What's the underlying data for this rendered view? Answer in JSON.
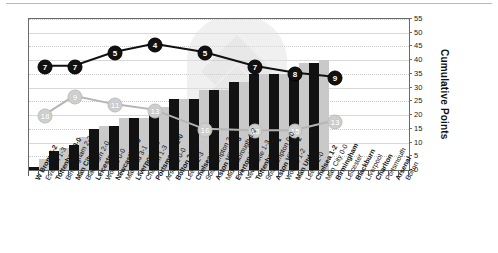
{
  "chart_data": {
    "type": "bar",
    "title": "",
    "xlabel": "",
    "ylabel": "Cumulative Points",
    "ylim": [
      0,
      55
    ],
    "ytick_step": 5,
    "yticks": [
      0,
      5,
      10,
      15,
      20,
      25,
      30,
      35,
      40,
      45,
      50,
      55
    ],
    "grid": true,
    "legend_position": "none",
    "categories": [
      "W Brom 3-2",
      "Everton 1-3",
      "Tottenham 3-0",
      "Birmingham 2-2",
      "Man City 2-2",
      "Blackburn 2-0",
      "Leicester 2-0",
      "Wolves 0-0",
      "Newcastle 2-3",
      "Man Utd 3-1",
      "Liverpool 1-2",
      "Charlton 1-3",
      "Portsmouth 2-0",
      "Arsenal 0-0",
      "Bolton 2-1",
      "Leeds 2-3",
      "Chelsea 0-1",
      "Southampton 2-0",
      "Aston Villa 0-3",
      "Middlesbrough 1-2",
      "Everton 2-1",
      "Newcastle 1-3",
      "Tottenham 2-1",
      "Southampton 0-0",
      "Aston Villa 1-2",
      "Wolves 1-2",
      "Man Utd 1-1",
      "Leeds 2-0",
      "Chelsea 1-2",
      "Man City 0-0",
      "Birmingham",
      "Leicester",
      "Blackburn",
      "Liverpool",
      "Charlton",
      "Portsmouth",
      "Arsenal",
      "Bolton"
    ],
    "series": [
      {
        "name": "Home bars",
        "kind": "bar",
        "values": [
          1,
          4,
          7,
          8,
          9,
          12,
          15,
          16,
          16,
          19,
          19,
          19,
          22,
          23,
          26,
          26,
          26,
          29,
          29,
          29,
          32,
          32,
          35,
          35,
          35,
          35,
          36,
          39,
          39,
          40,
          null,
          null,
          null,
          null,
          null,
          null,
          null,
          null
        ]
      },
      {
        "name": "Cumulative points (team A)",
        "kind": "line",
        "positions": [
          7,
          7,
          5,
          4,
          5,
          7,
          8,
          9
        ]
      },
      {
        "name": "Cumulative points (team B)",
        "kind": "line",
        "positions": [
          18,
          9,
          11,
          13,
          16,
          15,
          15,
          13
        ]
      }
    ],
    "marker_series_a": [
      {
        "index": 1,
        "label": "7"
      },
      {
        "index": 4,
        "label": "7"
      },
      {
        "index": 8,
        "label": "5"
      },
      {
        "index": 12,
        "label": "4"
      },
      {
        "index": 17,
        "label": "5"
      },
      {
        "index": 22,
        "label": "7"
      },
      {
        "index": 26,
        "label": "8"
      },
      {
        "index": 30,
        "label": "9"
      }
    ],
    "marker_series_b": [
      {
        "index": 1,
        "label": "18"
      },
      {
        "index": 4,
        "label": "9"
      },
      {
        "index": 8,
        "label": "11"
      },
      {
        "index": 12,
        "label": "13"
      },
      {
        "index": 17,
        "label": "16"
      },
      {
        "index": 22,
        "label": "15"
      },
      {
        "index": 26,
        "label": "15"
      },
      {
        "index": 30,
        "label": "13"
      }
    ],
    "colors": {
      "home_bar": "#121212",
      "away_bar": "#c9c9c9",
      "line_a": "#111111",
      "line_b": "#b5b5b5",
      "grid": "#d8d8d8",
      "axis": "#6b6b6b"
    }
  }
}
